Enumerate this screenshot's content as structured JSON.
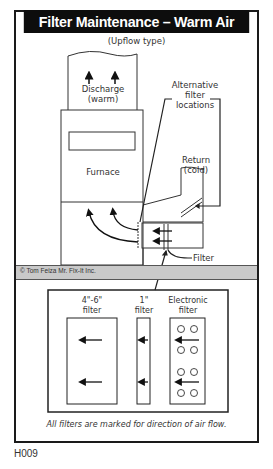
{
  "title": "Filter Maintenance – Warm Air Furnace",
  "subtitle": "(Upflow type)",
  "labels": {
    "discharge_line1": "Discharge",
    "discharge_line2": "(warm)",
    "furnace": "Furnace",
    "alt_line1": "Alternative",
    "alt_line2": "filter",
    "alt_line3": "locations",
    "return_line1": "Return",
    "return_line2": "(cold)",
    "filter": "Filter"
  },
  "copyright": "© Tom Feiza Mr. Fix-It Inc.",
  "filter_types": [
    {
      "line1": "4\"-6\"",
      "line2": "filter"
    },
    {
      "line1": "1\"",
      "line2": "filter"
    },
    {
      "line1": "Electronic",
      "line2": "filter"
    }
  ],
  "caption": "All filters are marked for direction of air flow.",
  "figure_code": "H009",
  "colors": {
    "title_bg": "#0d0d0d",
    "title_fg": "#ffffff",
    "band": "#c9c9c9",
    "line": "#1a1a1a"
  }
}
